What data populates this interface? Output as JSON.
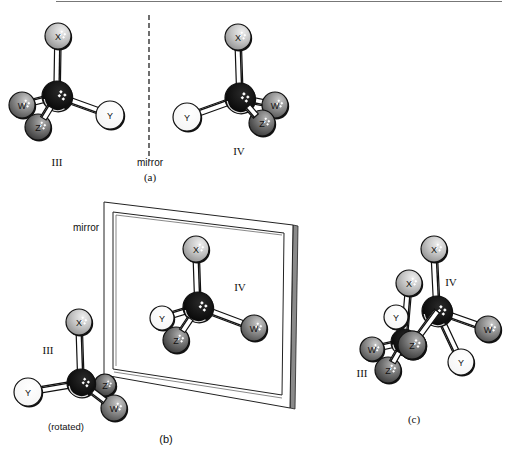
{
  "figure": {
    "panels": {
      "a": {
        "caption": "(a)",
        "mirror_label": "mirror",
        "left_molecule": {
          "label": "III",
          "atoms": [
            "X",
            "W",
            "Z",
            "Y"
          ]
        },
        "right_molecule": {
          "label": "IV",
          "atoms": [
            "X",
            "Y",
            "W",
            "Z"
          ]
        }
      },
      "b": {
        "caption": "(b)",
        "mirror_label": "mirror",
        "front_molecule": {
          "label": "III",
          "note": "(rotated)",
          "atoms": [
            "X",
            "Y",
            "Z",
            "W"
          ]
        },
        "reflected_molecule": {
          "label": "IV",
          "atoms": [
            "X",
            "Y",
            "Z",
            "W"
          ]
        }
      },
      "c": {
        "caption": "(c)",
        "molecule_iii": {
          "label": "III",
          "atoms": [
            "X",
            "Y",
            "W",
            "Z"
          ]
        },
        "molecule_iv": {
          "label": "IV",
          "atoms": [
            "X",
            "W",
            "Z",
            "Y"
          ]
        }
      }
    },
    "atom_colors": {
      "C": "#0a0a0a",
      "X": "#bdbdbd",
      "Y": "#ffffff",
      "Z": "#6e6e6e",
      "W": "#8a8a8a"
    }
  }
}
